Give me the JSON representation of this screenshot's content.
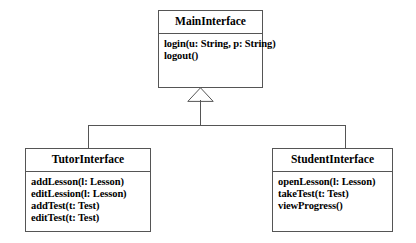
{
  "diagram": {
    "type": "uml-class-diagram",
    "relationship": "generalization",
    "colors": {
      "background": "#ffffff",
      "stroke": "#555555",
      "text": "#000000"
    },
    "classes": {
      "main": {
        "name": "MainInterface",
        "members": [
          "login(u: String, p: String)",
          "logout()"
        ]
      },
      "tutor": {
        "name": "TutorInterface",
        "members": [
          "addLesson(l: Lesson)",
          "editLession(l: Lesson)",
          "addTest(t: Test)",
          "editTest(t: Test)"
        ]
      },
      "student": {
        "name": "StudentInterface",
        "members": [
          "openLesson(l: Lesson)",
          "takeTest(t: Test)",
          "viewProgress()"
        ]
      }
    }
  }
}
